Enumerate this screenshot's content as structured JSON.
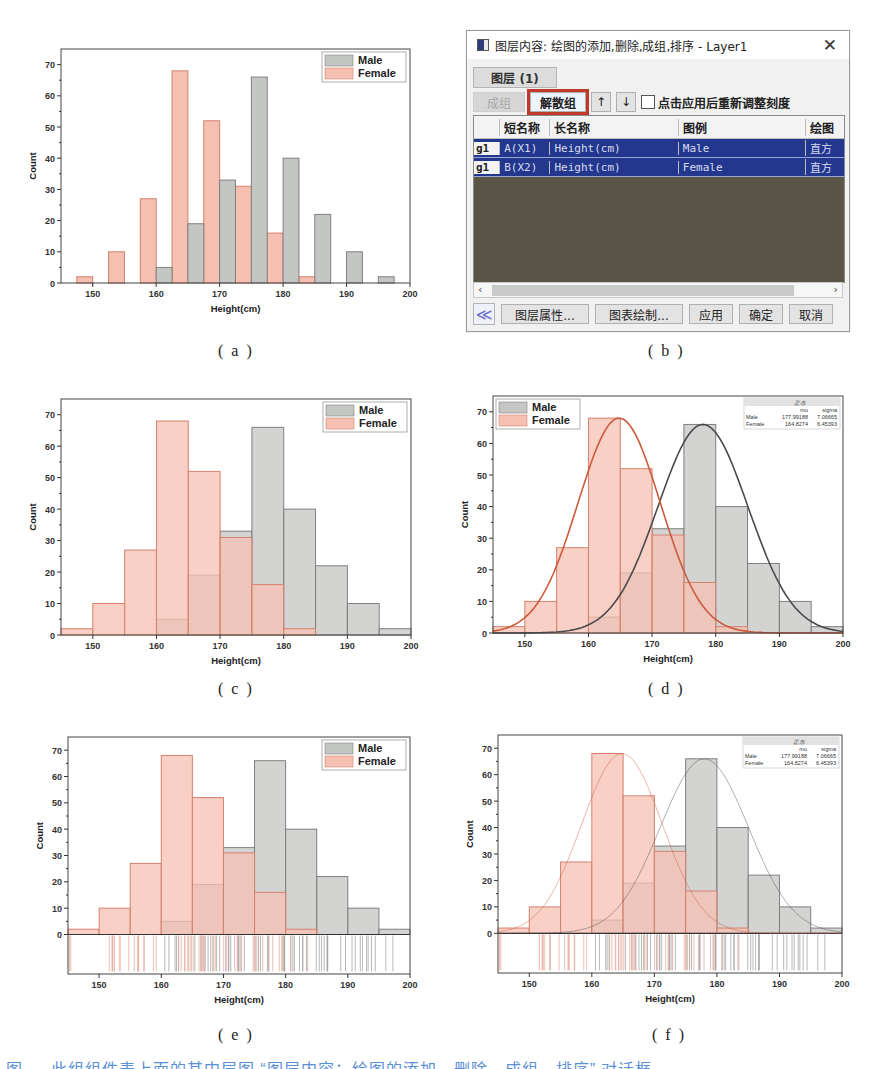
{
  "figure": {
    "captions": [
      "( a )",
      "( b )",
      "( c )",
      "( d )",
      "( e )",
      "( f )"
    ],
    "bottom_caption": "图 … 此组组件表上面的其中层图 “图层内容：绘图的添加，删除，成组，排序” 对话框"
  },
  "colors": {
    "male_fill": "#c4c6c3",
    "male_edge": "#7e807d",
    "female_fill": "#f5c0b1",
    "female_edge": "#d6806d",
    "male_curve": "#4a4a4a",
    "female_curve": "#cc5a3c"
  },
  "dialog": {
    "title": "图层内容: 绘图的添加,删除,成组,排序 - Layer1",
    "close_label": "✕",
    "layer_tab": "图层 (1)",
    "toolbar": {
      "group_label": "成组",
      "ungroup_label": "解散组",
      "up_label": "↑",
      "down_label": "↓",
      "rescale_checkbox_label": "点击应用后重新调整刻度",
      "rescale_checked": false
    },
    "table": {
      "headers": [
        "",
        "短名称",
        "长名称",
        "图例",
        "绘图"
      ],
      "rows": [
        {
          "group": "g1",
          "short": "A(X1)",
          "long": "Height(cm)",
          "legend": "Male",
          "plot": "直方"
        },
        {
          "group": "g1",
          "short": "B(X2)",
          "long": "Height(cm)",
          "legend": "Female",
          "plot": "直方"
        }
      ]
    },
    "scroll_left": "‹",
    "scroll_right": "›",
    "buttons": {
      "collapse": "≪",
      "layer_props": "图层属性...",
      "plot_setup": "图表绘制...",
      "apply": "应用",
      "ok": "确定",
      "cancel": "取消"
    }
  },
  "chart_data": [
    {
      "id": "a",
      "type": "bar",
      "mode": "side-by-side",
      "xlabel": "Height(cm)",
      "ylabel": "Count",
      "xlim": [
        145,
        200
      ],
      "ylim": [
        0,
        75
      ],
      "xticks": [
        150,
        160,
        170,
        180,
        190,
        200
      ],
      "yticks": [
        0,
        10,
        20,
        30,
        40,
        50,
        60,
        70
      ],
      "legend": [
        "Male",
        "Female"
      ],
      "legend_position": "top-right",
      "bin_width": 5,
      "series": [
        {
          "name": "Female",
          "bin_starts": [
            147.5,
            152.5,
            157.5,
            162.5,
            167.5,
            172.5,
            177.5,
            182.5
          ],
          "values": [
            2,
            10,
            27,
            68,
            52,
            31,
            16,
            2
          ]
        },
        {
          "name": "Male",
          "bin_starts": [
            160,
            165,
            170,
            175,
            180,
            185,
            190,
            195
          ],
          "values": [
            5,
            19,
            33,
            66,
            40,
            22,
            10,
            2
          ]
        }
      ]
    },
    {
      "id": "c",
      "type": "bar",
      "mode": "overlap",
      "xlabel": "Height(cm)",
      "ylabel": "Count",
      "xlim": [
        145,
        200
      ],
      "ylim": [
        0,
        75
      ],
      "xticks": [
        150,
        160,
        170,
        180,
        190,
        200
      ],
      "yticks": [
        0,
        10,
        20,
        30,
        40,
        50,
        60,
        70
      ],
      "legend": [
        "Male",
        "Female"
      ],
      "legend_position": "top-right",
      "bins": [
        145,
        150,
        155,
        160,
        165,
        170,
        175,
        180,
        185,
        190,
        195
      ],
      "series": [
        {
          "name": "Male",
          "values": [
            0,
            0,
            0,
            5,
            19,
            33,
            66,
            40,
            22,
            10,
            2
          ]
        },
        {
          "name": "Female",
          "values": [
            2,
            10,
            27,
            68,
            52,
            31,
            16,
            2,
            0,
            0,
            0
          ]
        }
      ]
    },
    {
      "id": "d",
      "type": "bar",
      "mode": "overlap+normal-fit",
      "xlabel": "Height(cm)",
      "ylabel": "Count",
      "xlim": [
        145,
        200
      ],
      "ylim": [
        0,
        75
      ],
      "xticks": [
        150,
        160,
        170,
        180,
        190,
        200
      ],
      "yticks": [
        0,
        10,
        20,
        30,
        40,
        50,
        60,
        70
      ],
      "legend": [
        "Male",
        "Female"
      ],
      "legend_position": "top-left",
      "bins": [
        145,
        150,
        155,
        160,
        165,
        170,
        175,
        180,
        185,
        190,
        195
      ],
      "series": [
        {
          "name": "Male",
          "values": [
            0,
            0,
            0,
            5,
            19,
            33,
            66,
            40,
            22,
            10,
            2
          ],
          "fit": {
            "mu": 177.99188,
            "sigma": 7.06665,
            "peak": 66
          }
        },
        {
          "name": "Female",
          "values": [
            2,
            10,
            27,
            68,
            52,
            31,
            16,
            2,
            0,
            0,
            0
          ],
          "fit": {
            "mu": 164.8274,
            "sigma": 6.45393,
            "peak": 68
          }
        }
      ],
      "stats_table": {
        "title": "正态",
        "headers": [
          "",
          "mu",
          "sigma"
        ],
        "rows": [
          [
            "Male",
            "177.99188",
            "7.06665"
          ],
          [
            "Female",
            "164.8274",
            "6.45393"
          ]
        ]
      }
    },
    {
      "id": "e",
      "type": "bar",
      "mode": "overlap+rug",
      "xlabel": "Height(cm)",
      "ylabel": "Count",
      "xlim": [
        145,
        200
      ],
      "ylim": [
        -15,
        75
      ],
      "xticks": [
        150,
        160,
        170,
        180,
        190,
        200
      ],
      "yticks": [
        0,
        10,
        20,
        30,
        40,
        50,
        60,
        70
      ],
      "legend": [
        "Male",
        "Female"
      ],
      "legend_position": "top-right",
      "bins": [
        145,
        150,
        155,
        160,
        165,
        170,
        175,
        180,
        185,
        190,
        195
      ],
      "series": [
        {
          "name": "Male",
          "values": [
            0,
            0,
            0,
            5,
            19,
            33,
            66,
            40,
            22,
            10,
            2
          ]
        },
        {
          "name": "Female",
          "values": [
            2,
            10,
            27,
            68,
            52,
            31,
            16,
            2,
            0,
            0,
            0
          ]
        }
      ]
    },
    {
      "id": "f",
      "type": "bar",
      "mode": "overlap+rug+normal-fit",
      "xlabel": "Height(cm)",
      "ylabel": "Count",
      "xlim": [
        145,
        200
      ],
      "ylim": [
        -15,
        75
      ],
      "xticks": [
        150,
        160,
        170,
        180,
        190,
        200
      ],
      "yticks": [
        0,
        10,
        20,
        30,
        40,
        50,
        60,
        70
      ],
      "legend": [],
      "legend_position": "none",
      "bins": [
        145,
        150,
        155,
        160,
        165,
        170,
        175,
        180,
        185,
        190,
        195
      ],
      "series": [
        {
          "name": "Male",
          "values": [
            0,
            0,
            0,
            5,
            19,
            33,
            66,
            40,
            22,
            10,
            2
          ],
          "fit": {
            "mu": 177.99188,
            "sigma": 7.06665,
            "peak": 66
          }
        },
        {
          "name": "Female",
          "values": [
            2,
            10,
            27,
            68,
            52,
            31,
            16,
            2,
            0,
            0,
            0
          ],
          "fit": {
            "mu": 164.8274,
            "sigma": 6.45393,
            "peak": 68
          }
        }
      ],
      "stats_table": {
        "title": "正态",
        "headers": [
          "",
          "mu",
          "sigma"
        ],
        "rows": [
          [
            "Male",
            "177.99188",
            "7.06665"
          ],
          [
            "Female",
            "164.8274",
            "6.45393"
          ]
        ]
      }
    }
  ]
}
